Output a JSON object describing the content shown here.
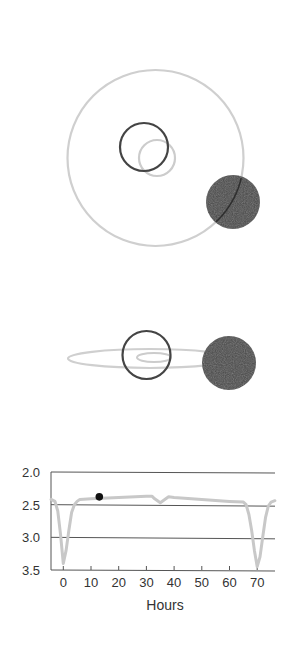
{
  "figure": {
    "top_view": {
      "orbit_outer": {
        "cx": 155.5,
        "cy": 158,
        "r": 88,
        "color": "#cfcfcf"
      },
      "ring_dark": {
        "cx": 144,
        "cy": 147,
        "r": 24,
        "color": "#444444"
      },
      "ring_light": {
        "cx": 157,
        "cy": 158,
        "r": 18,
        "color": "#cccccc"
      },
      "ball": {
        "cx": 233,
        "cy": 202,
        "r": 27,
        "color": "#4a4a4a"
      }
    },
    "side_view": {
      "orbit_outer": {
        "cx": 150,
        "cy": 358.5,
        "rx": 82,
        "ry": 9.5,
        "color": "#cfcfcf"
      },
      "orbit_inner": {
        "cx": 154,
        "cy": 357.5,
        "rx": 17,
        "ry": 4.5,
        "color": "#cccccc"
      },
      "ring_dark": {
        "cx": 146.5,
        "cy": 355,
        "r": 24,
        "color": "#444444"
      },
      "ball": {
        "cx": 229,
        "cy": 363,
        "r": 27,
        "color": "#4a4a4a"
      }
    }
  },
  "chart_data": {
    "type": "line",
    "title": "",
    "xlabel": "Hours",
    "ylabel": "",
    "xlim": [
      -4.4,
      76.5
    ],
    "ylim": [
      3.5,
      2.0
    ],
    "y_inverted": true,
    "xticks": [
      0,
      10,
      20,
      30,
      40,
      50,
      60,
      70
    ],
    "xtick_labels": [
      "0",
      "10",
      "20",
      "30",
      "40",
      "50",
      "60",
      "70"
    ],
    "yticks": [
      2.0,
      2.5,
      3.0,
      3.5
    ],
    "ytick_labels": [
      "2.0",
      "2.5",
      "3.0",
      "3.5"
    ],
    "grid": "horizontal",
    "series": [
      {
        "name": "light curve",
        "color": "#c8c8c8",
        "x": [
          -4.4,
          -3,
          -2,
          -1,
          0,
          1,
          2,
          3,
          4,
          5,
          6,
          10,
          20,
          30,
          32,
          33,
          35,
          37,
          38,
          40,
          50,
          60,
          65,
          66,
          67,
          68,
          69,
          70,
          71,
          72,
          73,
          74,
          75,
          76.4
        ],
        "y": [
          2.42,
          2.45,
          2.6,
          2.95,
          3.4,
          3.2,
          2.9,
          2.62,
          2.5,
          2.45,
          2.42,
          2.41,
          2.39,
          2.37,
          2.37,
          2.41,
          2.47,
          2.41,
          2.38,
          2.39,
          2.42,
          2.45,
          2.46,
          2.5,
          2.65,
          2.9,
          3.2,
          3.45,
          3.3,
          3.0,
          2.7,
          2.52,
          2.46,
          2.44
        ]
      }
    ],
    "marker": {
      "x": 13,
      "y": 2.38,
      "color": "#111111",
      "label": "current position"
    }
  }
}
